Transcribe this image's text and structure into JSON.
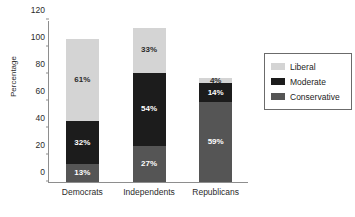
{
  "chart_data": {
    "type": "bar",
    "subtype": "stacked-bar",
    "title": "",
    "subtitle": "",
    "xlabel": "",
    "ylabel": "Percentage",
    "ylim": [
      0,
      120
    ],
    "yticks": [
      0,
      20,
      40,
      60,
      80,
      100,
      120
    ],
    "ytick_labels": [
      "0",
      "20",
      "40",
      "60",
      "80",
      "100",
      "120"
    ],
    "grid": false,
    "legend_position": "right",
    "categories": [
      "Democrats",
      "Independents",
      "Republicans"
    ],
    "series": [
      {
        "name": "Conservative",
        "color": "#555555",
        "label_color": "#ffffff",
        "values": [
          13,
          27,
          59
        ],
        "labels": [
          "13%",
          "27%",
          "59%"
        ]
      },
      {
        "name": "Moderate",
        "color": "#1c1c1c",
        "label_color": "#ffffff",
        "values": [
          32,
          54,
          14
        ],
        "labels": [
          "32%",
          "54%",
          "14%"
        ]
      },
      {
        "name": "Liberal",
        "color": "#d4d4d4",
        "label_color": "#2b2b2b",
        "values": [
          61,
          33,
          4
        ],
        "labels": [
          "61%",
          "33%",
          "4%"
        ]
      }
    ],
    "stack_order_bottom_to_top": [
      "Conservative",
      "Moderate",
      "Liberal"
    ],
    "totals": [
      106,
      114,
      77
    ],
    "legend_entries": [
      {
        "label": "Liberal",
        "color": "#d4d4d4"
      },
      {
        "label": "Moderate",
        "color": "#1c1c1c"
      },
      {
        "label": "Conservative",
        "color": "#555555"
      }
    ]
  },
  "axis_color": "#8e8e8e",
  "background": "#ffffff"
}
